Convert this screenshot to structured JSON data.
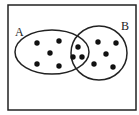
{
  "diagram": {
    "type": "venn",
    "colors": {
      "stroke": "#222222",
      "dot": "#111111",
      "background": "#ffffff"
    },
    "frame": {
      "x": 8,
      "y": 5,
      "width": 128,
      "height": 105
    },
    "sets": [
      {
        "id": "A",
        "label": "A",
        "cx": 52,
        "cy": 52,
        "rx": 37,
        "ry": 22,
        "label_x": 15,
        "label_y": 36
      },
      {
        "id": "B",
        "label": "B",
        "cx": 99,
        "cy": 53,
        "rx": 28,
        "ry": 27,
        "label_x": 121,
        "label_y": 30
      }
    ],
    "regions": {
      "A_only": {
        "count": 5,
        "points": [
          [
            37,
            43
          ],
          [
            59,
            41
          ],
          [
            50,
            53
          ],
          [
            37,
            64
          ],
          [
            59,
            66
          ]
        ]
      },
      "A_and_B": {
        "count": 3,
        "points": [
          [
            78,
            47
          ],
          [
            73,
            57
          ],
          [
            82,
            57
          ]
        ]
      },
      "B_only": {
        "count": 5,
        "points": [
          [
            98,
            42
          ],
          [
            116,
            43
          ],
          [
            106,
            54
          ],
          [
            94,
            64
          ],
          [
            113,
            67
          ]
        ]
      }
    },
    "dot_radius": 2.7
  }
}
